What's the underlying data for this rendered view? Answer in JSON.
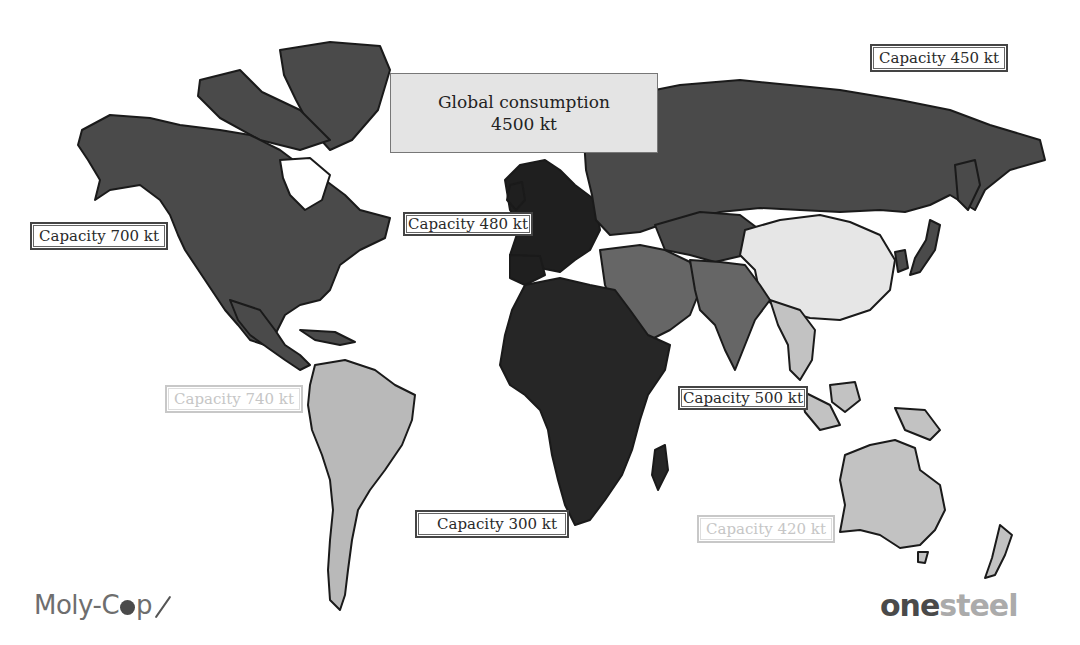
{
  "map": {
    "title": "Global consumption",
    "global_consumption": "4500 kt",
    "colors": {
      "north_america": "#4a4a4a",
      "russia": "#4a4a4a",
      "europe": "#1f1f1f",
      "africa": "#262626",
      "middle_east_south_asia": "#666666",
      "china_east_asia": "#e6e6e6",
      "south_america": "#b9b9b9",
      "oceania_se_asia": "#c2c2c2"
    },
    "regions": [
      {
        "name": "North America",
        "capacity_label": "Capacity 700 kt",
        "capacity_kt": 700
      },
      {
        "name": "Russia / CIS",
        "capacity_label": "Capacity 450 kt",
        "capacity_kt": 450
      },
      {
        "name": "Europe",
        "capacity_label": "Capacity 480 kt",
        "capacity_kt": 480
      },
      {
        "name": "South America",
        "capacity_label": "Capacity 740 kt",
        "capacity_kt": 740
      },
      {
        "name": "Asia",
        "capacity_label": "Capacity 500 kt",
        "capacity_kt": 500
      },
      {
        "name": "Africa",
        "capacity_label": "Capacity 300 kt",
        "capacity_kt": 300
      },
      {
        "name": "Australasia",
        "capacity_label": "Capacity 420 kt",
        "capacity_kt": 420
      }
    ]
  },
  "logos": {
    "left_pre": "Moly-C",
    "left_post": "p",
    "right_one": "one",
    "right_steel": "steel"
  }
}
